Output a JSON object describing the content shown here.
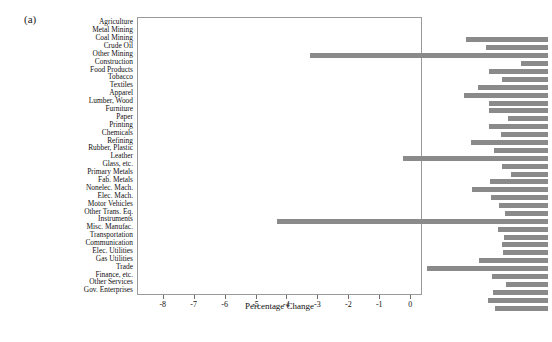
{
  "figure": {
    "panel_label": "(a)",
    "bar_color": "#8a8a8a",
    "frame_color": "#9a9a9a"
  },
  "chart_data": {
    "type": "bar",
    "orientation": "horizontal",
    "title": "",
    "xlabel": "Percentage Change",
    "ylabel": "",
    "xlim": [
      -8.8,
      0.35
    ],
    "grid": false,
    "legend": null,
    "xticks": [
      -8,
      -7,
      -6,
      -5,
      -4,
      -3,
      -2,
      -1,
      0
    ],
    "xticklabels": [
      "-8",
      "-7",
      "-6",
      "-5",
      "-4",
      "-3",
      "-2",
      "-1",
      "0"
    ],
    "categories": [
      "Agriculture",
      "Metal Mining",
      "Coal Mining",
      "Crude Oil",
      "Other Mining",
      "Construction",
      "Food Products",
      "Tobacco",
      "Textiles",
      "Apparel",
      "Lumber, Wood",
      "Furniture",
      "Paper",
      "Printing",
      "Chemicals",
      "Refining",
      "Rubber, Plastic",
      "Leather",
      "Glass, etc.",
      "Primary Metals",
      "Fab. Metals",
      "Nonelec. Mach.",
      "Elec. Mach.",
      "Motor Vehicles",
      "Other Trans. Eq.",
      "Instruments",
      "Misc. Manufac.",
      "Transportation",
      "Communication",
      "Elec. Utilities",
      "Gas Utilities",
      "Trade",
      "Finance, etc.",
      "Other Services",
      "Gov. Enterprises"
    ],
    "values": [
      -2.66,
      -2.01,
      -7.69,
      -0.88,
      -1.91,
      -1.5,
      -2.28,
      -2.73,
      -1.91,
      -1.91,
      -1.3,
      -1.91,
      -1.53,
      -2.5,
      -1.75,
      -4.68,
      -1.5,
      -1.2,
      -1.88,
      -2.45,
      -1.85,
      -1.59,
      -1.4,
      -8.77,
      -1.62,
      -1.43,
      -1.5,
      -1.46,
      -2.24,
      -3.93,
      -1.82,
      -1.36,
      -1.79,
      -1.95,
      -1.72
    ]
  }
}
